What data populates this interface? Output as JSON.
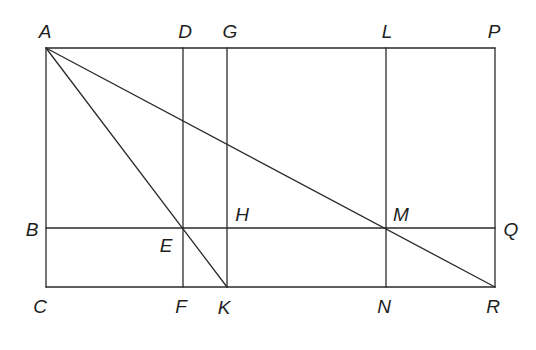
{
  "diagram": {
    "points": {
      "A": {
        "x": 46,
        "y": 48
      },
      "D": {
        "x": 183,
        "y": 48
      },
      "G": {
        "x": 227,
        "y": 48
      },
      "L": {
        "x": 386,
        "y": 48
      },
      "P": {
        "x": 495,
        "y": 48
      },
      "B": {
        "x": 46,
        "y": 228
      },
      "E": {
        "x": 183,
        "y": 228
      },
      "H": {
        "x": 227,
        "y": 228
      },
      "M": {
        "x": 386,
        "y": 228
      },
      "Q": {
        "x": 495,
        "y": 228
      },
      "C": {
        "x": 46,
        "y": 287
      },
      "F": {
        "x": 183,
        "y": 287
      },
      "K": {
        "x": 227,
        "y": 287
      },
      "N": {
        "x": 386,
        "y": 287
      },
      "R": {
        "x": 495,
        "y": 287
      }
    },
    "segments": [
      [
        "A",
        "P"
      ],
      [
        "A",
        "C"
      ],
      [
        "P",
        "R"
      ],
      [
        "C",
        "R"
      ],
      [
        "B",
        "Q"
      ],
      [
        "D",
        "F"
      ],
      [
        "G",
        "K"
      ],
      [
        "L",
        "N"
      ],
      [
        "A",
        "K"
      ],
      [
        "A",
        "R"
      ]
    ],
    "labels": [
      {
        "text": "A",
        "x": 45,
        "y": 33
      },
      {
        "text": "D",
        "x": 185,
        "y": 33
      },
      {
        "text": "G",
        "x": 230,
        "y": 33
      },
      {
        "text": "L",
        "x": 387,
        "y": 33
      },
      {
        "text": "P",
        "x": 494,
        "y": 33
      },
      {
        "text": "B",
        "x": 32,
        "y": 231
      },
      {
        "text": "H",
        "x": 242,
        "y": 216
      },
      {
        "text": "E",
        "x": 166,
        "y": 247
      },
      {
        "text": "M",
        "x": 401,
        "y": 216
      },
      {
        "text": "Q",
        "x": 511,
        "y": 231
      },
      {
        "text": "C",
        "x": 40,
        "y": 308
      },
      {
        "text": "F",
        "x": 181,
        "y": 308
      },
      {
        "text": "K",
        "x": 224,
        "y": 309
      },
      {
        "text": "N",
        "x": 384,
        "y": 308
      },
      {
        "text": "R",
        "x": 493,
        "y": 308
      }
    ],
    "colors": {
      "line": "#2a2a2a",
      "label": "#1e1e1e",
      "background": "#ffffff"
    }
  }
}
